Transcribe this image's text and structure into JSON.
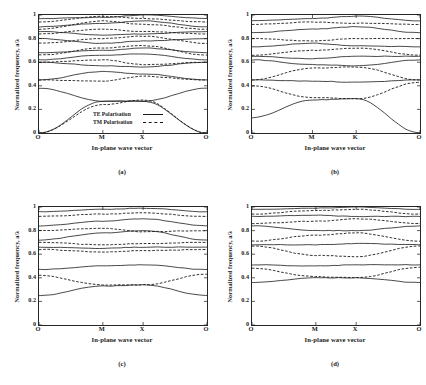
{
  "figure": {
    "background": "#ffffff",
    "ink": "#1a1a1a"
  },
  "axes": {
    "ylabel": "Normalized frequency, a/λ",
    "xlabel": "In-plane wave vector",
    "yticks": [
      "1",
      "0.8",
      "0.6",
      "0.4",
      "0.2",
      "0"
    ],
    "ytick_values": [
      1,
      0.8,
      0.6,
      0.4,
      0.2,
      0
    ],
    "ylim": [
      0,
      1
    ]
  },
  "legend": {
    "te_label": "TE Polarisation",
    "tm_label": "TM Polarisation",
    "te_style": "solid",
    "tm_style": "dashed"
  },
  "panels": [
    {
      "id": "a",
      "caption": "(a)",
      "xticks": [
        "O",
        "M",
        "X",
        "O"
      ]
    },
    {
      "id": "b",
      "caption": "(b)",
      "xticks": [
        "O",
        "M",
        "K",
        "O"
      ]
    },
    {
      "id": "c",
      "caption": "(c)",
      "xticks": [
        "O",
        "M",
        "X",
        "O"
      ]
    },
    {
      "id": "d",
      "caption": "(d)",
      "xticks": [
        "O",
        "M",
        "X",
        "O"
      ]
    }
  ],
  "chart_data": [
    {
      "type": "line",
      "panel": "(a)",
      "title": "",
      "xlabel": "In-plane wave vector",
      "ylabel": "Normalized frequency, a/λ",
      "ylim": [
        0,
        1
      ],
      "grid": false,
      "legend_position": "inside-lower-center",
      "x_tick_labels": [
        "O",
        "M",
        "X",
        "O"
      ],
      "x_tick_positions": [
        0,
        0.38,
        0.62,
        1
      ],
      "series": [
        {
          "name": "TE band 1",
          "style": "solid",
          "x": [
            0,
            0.38,
            0.62,
            1
          ],
          "values": [
            0.0,
            0.27,
            0.27,
            0.0
          ]
        },
        {
          "name": "TE band 2",
          "style": "solid",
          "x": [
            0,
            0.38,
            0.62,
            1
          ],
          "values": [
            0.38,
            0.27,
            0.27,
            0.38
          ]
        },
        {
          "name": "TE band 3",
          "style": "solid",
          "x": [
            0,
            0.38,
            0.62,
            1
          ],
          "values": [
            0.45,
            0.52,
            0.5,
            0.45
          ]
        },
        {
          "name": "TE band 4",
          "style": "solid",
          "x": [
            0,
            0.38,
            0.62,
            1
          ],
          "values": [
            0.6,
            0.57,
            0.56,
            0.6
          ]
        },
        {
          "name": "TE band 5",
          "style": "solid",
          "x": [
            0,
            0.38,
            0.62,
            1
          ],
          "values": [
            0.62,
            0.66,
            0.67,
            0.62
          ]
        },
        {
          "name": "TE band 6",
          "style": "solid",
          "x": [
            0,
            0.38,
            0.62,
            1
          ],
          "values": [
            0.68,
            0.7,
            0.72,
            0.68
          ]
        },
        {
          "name": "TE band 7",
          "style": "solid",
          "x": [
            0,
            0.38,
            0.62,
            1
          ],
          "values": [
            0.8,
            0.76,
            0.78,
            0.8
          ]
        },
        {
          "name": "TE band 8",
          "style": "solid",
          "x": [
            0,
            0.38,
            0.62,
            1
          ],
          "values": [
            0.86,
            0.83,
            0.84,
            0.86
          ]
        },
        {
          "name": "TE band 9",
          "style": "solid",
          "x": [
            0,
            0.38,
            0.62,
            1
          ],
          "values": [
            0.9,
            0.93,
            0.95,
            0.9
          ]
        },
        {
          "name": "TE band 10",
          "style": "solid",
          "x": [
            0,
            0.38,
            0.62,
            1
          ],
          "values": [
            0.97,
            0.98,
            1.0,
            0.97
          ]
        },
        {
          "name": "TM band 1",
          "style": "dashed",
          "x": [
            0,
            0.38,
            0.62,
            1
          ],
          "values": [
            0.0,
            0.24,
            0.28,
            0.0
          ]
        },
        {
          "name": "TM band 2",
          "style": "dashed",
          "x": [
            0,
            0.38,
            0.62,
            1
          ],
          "values": [
            0.45,
            0.44,
            0.48,
            0.45
          ]
        },
        {
          "name": "TM band 3",
          "style": "dashed",
          "x": [
            0,
            0.38,
            0.62,
            1
          ],
          "values": [
            0.6,
            0.62,
            0.58,
            0.6
          ]
        },
        {
          "name": "TM band 4",
          "style": "dashed",
          "x": [
            0,
            0.38,
            0.62,
            1
          ],
          "values": [
            0.66,
            0.72,
            0.74,
            0.66
          ]
        },
        {
          "name": "TM band 5",
          "style": "dashed",
          "x": [
            0,
            0.38,
            0.62,
            1
          ],
          "values": [
            0.76,
            0.8,
            0.82,
            0.76
          ]
        },
        {
          "name": "TM band 6",
          "style": "dashed",
          "x": [
            0,
            0.38,
            0.62,
            1
          ],
          "values": [
            0.84,
            0.88,
            0.86,
            0.84
          ]
        },
        {
          "name": "TM band 7",
          "style": "dashed",
          "x": [
            0,
            0.38,
            0.62,
            1
          ],
          "values": [
            0.88,
            0.95,
            0.92,
            0.88
          ]
        },
        {
          "name": "TM band 8",
          "style": "dashed",
          "x": [
            0,
            0.38,
            0.62,
            1
          ],
          "values": [
            0.94,
            0.99,
            0.97,
            0.94
          ]
        }
      ]
    },
    {
      "type": "line",
      "panel": "(b)",
      "title": "",
      "xlabel": "In-plane wave vector",
      "ylabel": "Normalized frequency, a/λ",
      "ylim": [
        0,
        1
      ],
      "grid": false,
      "legend_position": "none",
      "x_tick_labels": [
        "O",
        "M",
        "K",
        "O"
      ],
      "x_tick_positions": [
        0,
        0.36,
        0.62,
        1
      ],
      "series": [
        {
          "name": "band 1",
          "style": "solid",
          "x": [
            0,
            0.36,
            0.62,
            1
          ],
          "values": [
            0.13,
            0.28,
            0.29,
            0.0
          ]
        },
        {
          "name": "band 2",
          "style": "dashed",
          "x": [
            0,
            0.36,
            0.62,
            1
          ],
          "values": [
            0.4,
            0.3,
            0.29,
            0.43
          ]
        },
        {
          "name": "band 3",
          "style": "solid",
          "x": [
            0,
            0.36,
            0.62,
            1
          ],
          "values": [
            0.45,
            0.44,
            0.43,
            0.45
          ]
        },
        {
          "name": "band 4",
          "style": "dashed",
          "x": [
            0,
            0.36,
            0.62,
            1
          ],
          "values": [
            0.45,
            0.55,
            0.56,
            0.45
          ]
        },
        {
          "name": "band 5",
          "style": "solid",
          "x": [
            0,
            0.36,
            0.62,
            1
          ],
          "values": [
            0.62,
            0.58,
            0.57,
            0.62
          ]
        },
        {
          "name": "band 6",
          "style": "solid",
          "x": [
            0,
            0.36,
            0.62,
            1
          ],
          "values": [
            0.65,
            0.63,
            0.65,
            0.65
          ]
        },
        {
          "name": "band 7",
          "style": "dashed",
          "x": [
            0,
            0.36,
            0.62,
            1
          ],
          "values": [
            0.66,
            0.7,
            0.72,
            0.66
          ]
        },
        {
          "name": "band 8",
          "style": "solid",
          "x": [
            0,
            0.36,
            0.62,
            1
          ],
          "values": [
            0.73,
            0.76,
            0.74,
            0.73
          ]
        },
        {
          "name": "band 9",
          "style": "dashed",
          "x": [
            0,
            0.36,
            0.62,
            1
          ],
          "values": [
            0.8,
            0.78,
            0.8,
            0.8
          ]
        },
        {
          "name": "band 10",
          "style": "solid",
          "x": [
            0,
            0.36,
            0.62,
            1
          ],
          "values": [
            0.85,
            0.88,
            0.9,
            0.85
          ]
        },
        {
          "name": "band 11",
          "style": "dashed",
          "x": [
            0,
            0.36,
            0.62,
            1
          ],
          "values": [
            0.92,
            0.94,
            0.93,
            0.92
          ]
        },
        {
          "name": "band 12",
          "style": "solid",
          "x": [
            0,
            0.36,
            0.62,
            1
          ],
          "values": [
            0.95,
            0.97,
            0.99,
            0.95
          ]
        }
      ]
    },
    {
      "type": "line",
      "panel": "(c)",
      "title": "",
      "xlabel": "In-plane wave vector",
      "ylabel": "Normalized frequency, a/λ",
      "ylim": [
        0,
        1
      ],
      "grid": false,
      "legend_position": "none",
      "x_tick_labels": [
        "O",
        "M",
        "X",
        "O"
      ],
      "x_tick_positions": [
        0,
        0.38,
        0.62,
        1
      ],
      "series": [
        {
          "name": "band 1",
          "style": "solid",
          "x": [
            0,
            0.38,
            0.62,
            1
          ],
          "values": [
            0.25,
            0.33,
            0.34,
            0.25
          ]
        },
        {
          "name": "band 2",
          "style": "dashed",
          "x": [
            0,
            0.38,
            0.62,
            1
          ],
          "values": [
            0.42,
            0.34,
            0.34,
            0.43
          ]
        },
        {
          "name": "band 3",
          "style": "solid",
          "x": [
            0,
            0.38,
            0.62,
            1
          ],
          "values": [
            0.47,
            0.5,
            0.51,
            0.47
          ]
        },
        {
          "name": "band 4",
          "style": "dashed",
          "x": [
            0,
            0.38,
            0.62,
            1
          ],
          "values": [
            0.64,
            0.62,
            0.63,
            0.64
          ]
        },
        {
          "name": "band 5",
          "style": "solid",
          "x": [
            0,
            0.38,
            0.62,
            1
          ],
          "values": [
            0.66,
            0.65,
            0.66,
            0.66
          ]
        },
        {
          "name": "band 6",
          "style": "dashed",
          "x": [
            0,
            0.38,
            0.62,
            1
          ],
          "values": [
            0.7,
            0.68,
            0.69,
            0.7
          ]
        },
        {
          "name": "band 7",
          "style": "solid",
          "x": [
            0,
            0.38,
            0.62,
            1
          ],
          "values": [
            0.72,
            0.78,
            0.8,
            0.72
          ]
        },
        {
          "name": "band 8",
          "style": "dashed",
          "x": [
            0,
            0.38,
            0.62,
            1
          ],
          "values": [
            0.8,
            0.82,
            0.79,
            0.8
          ]
        },
        {
          "name": "band 9",
          "style": "solid",
          "x": [
            0,
            0.38,
            0.62,
            1
          ],
          "values": [
            0.84,
            0.88,
            0.9,
            0.84
          ]
        },
        {
          "name": "band 10",
          "style": "dashed",
          "x": [
            0,
            0.38,
            0.62,
            1
          ],
          "values": [
            0.92,
            0.94,
            0.95,
            0.92
          ]
        },
        {
          "name": "band 11",
          "style": "solid",
          "x": [
            0,
            0.38,
            0.62,
            1
          ],
          "values": [
            0.96,
            0.98,
            0.99,
            0.96
          ]
        }
      ]
    },
    {
      "type": "line",
      "panel": "(d)",
      "title": "",
      "xlabel": "In-plane wave vector",
      "ylabel": "Normalized frequency, a/λ",
      "ylim": [
        0,
        1
      ],
      "grid": false,
      "legend_position": "none",
      "x_tick_labels": [
        "O",
        "M",
        "X",
        "O"
      ],
      "x_tick_positions": [
        0,
        0.38,
        0.62,
        1
      ],
      "series": [
        {
          "name": "band 1",
          "style": "solid",
          "x": [
            0,
            0.38,
            0.62,
            1
          ],
          "values": [
            0.36,
            0.4,
            0.4,
            0.36
          ]
        },
        {
          "name": "band 2",
          "style": "dashed",
          "x": [
            0,
            0.38,
            0.62,
            1
          ],
          "values": [
            0.48,
            0.41,
            0.4,
            0.49
          ]
        },
        {
          "name": "band 3",
          "style": "solid",
          "x": [
            0,
            0.38,
            0.62,
            1
          ],
          "values": [
            0.51,
            0.5,
            0.51,
            0.51
          ]
        },
        {
          "name": "band 4",
          "style": "dashed",
          "x": [
            0,
            0.38,
            0.62,
            1
          ],
          "values": [
            0.67,
            0.59,
            0.58,
            0.67
          ]
        },
        {
          "name": "band 5",
          "style": "solid",
          "x": [
            0,
            0.38,
            0.62,
            1
          ],
          "values": [
            0.68,
            0.68,
            0.69,
            0.68
          ]
        },
        {
          "name": "band 6",
          "style": "dashed",
          "x": [
            0,
            0.38,
            0.62,
            1
          ],
          "values": [
            0.71,
            0.76,
            0.78,
            0.71
          ]
        },
        {
          "name": "band 7",
          "style": "solid",
          "x": [
            0,
            0.38,
            0.62,
            1
          ],
          "values": [
            0.84,
            0.8,
            0.8,
            0.84
          ]
        },
        {
          "name": "band 8",
          "style": "dashed",
          "x": [
            0,
            0.38,
            0.62,
            1
          ],
          "values": [
            0.86,
            0.88,
            0.9,
            0.86
          ]
        },
        {
          "name": "band 9",
          "style": "solid",
          "x": [
            0,
            0.38,
            0.62,
            1
          ],
          "values": [
            0.92,
            0.93,
            0.92,
            0.92
          ]
        },
        {
          "name": "band 10",
          "style": "dashed",
          "x": [
            0,
            0.38,
            0.62,
            1
          ],
          "values": [
            0.94,
            0.97,
            0.98,
            0.94
          ]
        },
        {
          "name": "band 11",
          "style": "solid",
          "x": [
            0,
            0.38,
            0.62,
            1
          ],
          "values": [
            0.98,
            0.99,
            1.0,
            0.98
          ]
        }
      ]
    }
  ]
}
